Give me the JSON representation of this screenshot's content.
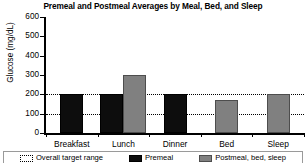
{
  "chart_data": {
    "type": "bar",
    "title": "Premeal and Postmeal Averages by Meal, Bed, and Sleep",
    "xlabel": "",
    "ylabel": "Glucose (mg/dL)",
    "ylim": [
      0,
      600
    ],
    "yticks": [
      0,
      100,
      200,
      300,
      400,
      500,
      600
    ],
    "ytick_labels": [
      "0",
      "100",
      "200",
      "300",
      "400",
      "500",
      "600"
    ],
    "categories": [
      "Breakfast",
      "Lunch",
      "Dinner",
      "Bed",
      "Sleep"
    ],
    "grid": false,
    "legend_position": "bottom",
    "series": [
      {
        "name": "Premeal",
        "color": "#0d0d0d",
        "values": [
          200,
          200,
          200,
          null,
          null
        ]
      },
      {
        "name": "Postmeal, bed, sleep",
        "color": "#808080",
        "values": [
          null,
          300,
          null,
          170,
          200
        ]
      }
    ],
    "annotations": [
      {
        "name": "Overall target range",
        "type": "dotted-band",
        "lower": 100,
        "upper": 200,
        "color": "#000000"
      }
    ]
  },
  "legend": {
    "entries": [
      {
        "label": "Overall target range",
        "swatch": "range"
      },
      {
        "label": "Premeal",
        "swatch": "premeal"
      },
      {
        "label": "Postmeal, bed, sleep",
        "swatch": "postmeal"
      }
    ]
  }
}
